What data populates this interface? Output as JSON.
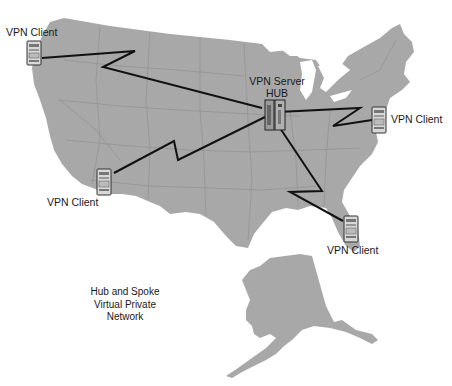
{
  "diagram": {
    "title_lines": [
      "Hub and Spoke",
      "Virtual Private",
      "Network"
    ],
    "colors": {
      "land": "#a8a8a8",
      "state_border": "#8f8f8f",
      "link_line": "#111111",
      "background": "#ffffff",
      "text": "#1a1a1a"
    },
    "hub": {
      "label_line1": "VPN Server",
      "label_line2": "HUB",
      "icon": "server-rack-icon"
    },
    "clients": [
      {
        "id": "northwest",
        "label": "VPN Client",
        "icon": "server-tower-icon"
      },
      {
        "id": "east",
        "label": "VPN Client",
        "icon": "server-tower-icon"
      },
      {
        "id": "southwest",
        "label": "VPN Client",
        "icon": "server-tower-icon"
      },
      {
        "id": "southeast",
        "label": "VPN Client",
        "icon": "server-tower-icon"
      }
    ],
    "links": [
      {
        "from": "northwest",
        "to": "hub",
        "style": "lightning-zigzag"
      },
      {
        "from": "southwest",
        "to": "hub",
        "style": "lightning-zigzag"
      },
      {
        "from": "east",
        "to": "hub",
        "style": "lightning-zigzag"
      },
      {
        "from": "southeast",
        "to": "hub",
        "style": "lightning-zigzag"
      }
    ]
  }
}
